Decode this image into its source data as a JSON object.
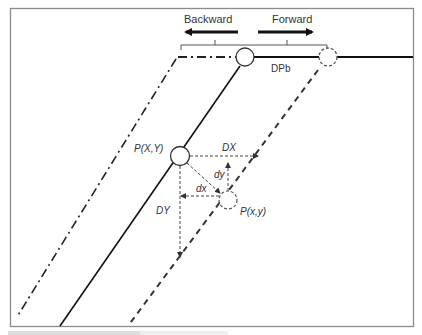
{
  "diagram": {
    "labels": {
      "backward": "Backward",
      "forward": "Forward",
      "dpb": "DPb",
      "p_upper": "P(X,Y)",
      "p_lower": "P(x,y)",
      "DX": "DX",
      "DY": "DY",
      "dx": "dx",
      "dy": "dy"
    },
    "colors": {
      "frame": "#8c8c8c",
      "line": "#111111",
      "dashed": "#444444",
      "text": "#333333"
    },
    "lines": [
      {
        "name": "dash-dot-line",
        "style": "dash-dot",
        "meaning": "backward shifted line"
      },
      {
        "name": "solid-line",
        "style": "solid",
        "meaning": "original line"
      },
      {
        "name": "dashed-line",
        "style": "dashed",
        "meaning": "forward shifted line"
      }
    ]
  },
  "caption": {
    "text": ""
  }
}
